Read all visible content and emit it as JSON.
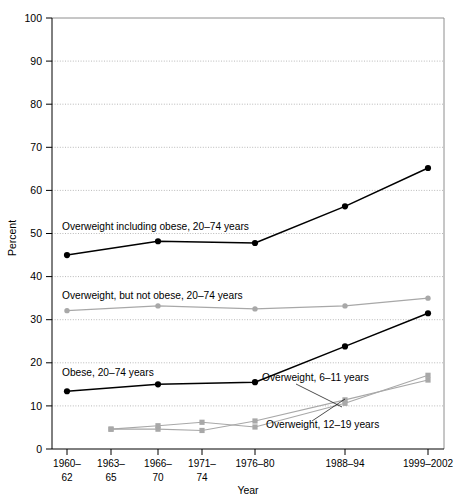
{
  "chart_data": {
    "type": "line",
    "title": "",
    "xlabel": "Year",
    "ylabel": "Percent",
    "ylim": [
      0,
      100
    ],
    "ytick_values": [
      0,
      10,
      20,
      30,
      40,
      50,
      60,
      70,
      80,
      90,
      100
    ],
    "ytick_labels": [
      "0",
      "10",
      "20",
      "30",
      "40",
      "50",
      "60",
      "70",
      "80",
      "90",
      "100"
    ],
    "grid": true,
    "grid_axis": "y",
    "legend_position": "inline-annotations",
    "categories": [
      "1960–62",
      "1963–65",
      "1966–70",
      "1971–74",
      "1976–80",
      "1988–94",
      "1999–2002"
    ],
    "category_lines": [
      [
        "1960–",
        "62"
      ],
      [
        "1963–",
        "65"
      ],
      [
        "1966–",
        "70"
      ],
      [
        "1971–",
        "74"
      ],
      [
        "1976–80",
        ""
      ],
      [
        "1988–94",
        ""
      ],
      [
        "1999–2002",
        ""
      ]
    ],
    "x_positions_px": [
      67,
      111,
      158,
      202,
      255,
      345,
      428
    ],
    "series": [
      {
        "name": "Overweight including obese, 20–74 years",
        "color": "#000000",
        "marker": "filled-circle",
        "values": [
          45.0,
          null,
          48.2,
          null,
          47.8,
          56.3,
          65.2
        ],
        "label_x_px": 62,
        "label_y_px": 230
      },
      {
        "name": "Overweight, but not obese, 20–74 years",
        "color": "#a8a8a8",
        "marker": "filled-circle",
        "values": [
          32.1,
          null,
          33.2,
          null,
          32.5,
          33.2,
          35.0
        ],
        "label_x_px": 62,
        "label_y_px": 299
      },
      {
        "name": "Obese, 20–74 years",
        "color": "#000000",
        "marker": "filled-circle",
        "values": [
          13.4,
          null,
          15.0,
          null,
          15.5,
          23.8,
          31.5
        ],
        "label_x_px": 62,
        "label_y_px": 376
      },
      {
        "name": "Overweight, 6–11 years",
        "color": "#a8a8a8",
        "marker": "filled-square",
        "values": [
          null,
          4.6,
          4.6,
          4.3,
          6.5,
          11.4,
          16.0
        ],
        "label_x_px": 262,
        "label_y_px": 381
      },
      {
        "name": "Overweight, 12–19 years",
        "color": "#a8a8a8",
        "marker": "filled-square",
        "values": [
          null,
          4.6,
          5.4,
          6.2,
          5.1,
          10.6,
          17.1
        ],
        "label_x_px": 266,
        "label_y_px": 428
      }
    ],
    "annotation_leaders": [
      {
        "for": "Overweight, 6–11 years",
        "from_x_px": 296,
        "from_y_px": 384,
        "to_x_px": 342,
        "to_y_px": 407
      },
      {
        "for": "Overweight, 12–19 years",
        "from_x_px": 312,
        "from_y_px": 421,
        "to_x_px": 345,
        "to_y_px": 399
      }
    ],
    "plot_area_px": {
      "left": 52,
      "right": 444,
      "top": 18,
      "bottom": 449
    }
  }
}
